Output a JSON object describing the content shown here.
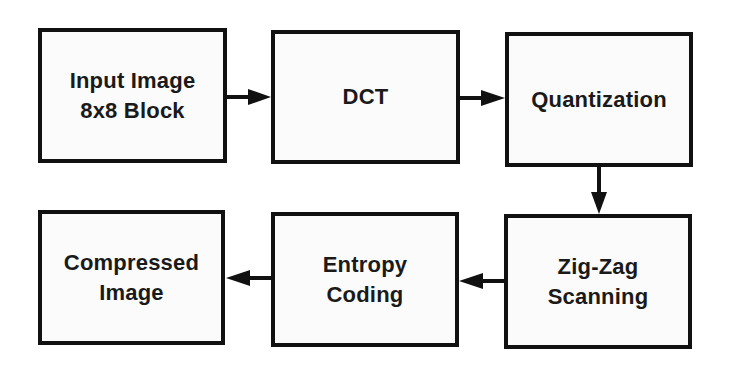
{
  "diagram": {
    "type": "flowchart",
    "direction": "snake: left-to-right top row, down, right-to-left bottom row",
    "nodes": [
      {
        "id": "input",
        "label": "Input Image\n8x8 Block"
      },
      {
        "id": "dct",
        "label": "DCT"
      },
      {
        "id": "quant",
        "label": "Quantization"
      },
      {
        "id": "zigzag",
        "label": "Zig-Zag\nScanning"
      },
      {
        "id": "entropy",
        "label": "Entropy\nCoding"
      },
      {
        "id": "compressed",
        "label": "Compressed\nImage"
      }
    ],
    "edges": [
      {
        "from": "input",
        "to": "dct"
      },
      {
        "from": "dct",
        "to": "quant"
      },
      {
        "from": "quant",
        "to": "zigzag"
      },
      {
        "from": "zigzag",
        "to": "entropy"
      },
      {
        "from": "entropy",
        "to": "compressed"
      }
    ],
    "colors": {
      "stroke": "#111111",
      "box_fill": "#fbfbfb",
      "text": "#1a1a1a",
      "background": "#ffffff"
    }
  }
}
